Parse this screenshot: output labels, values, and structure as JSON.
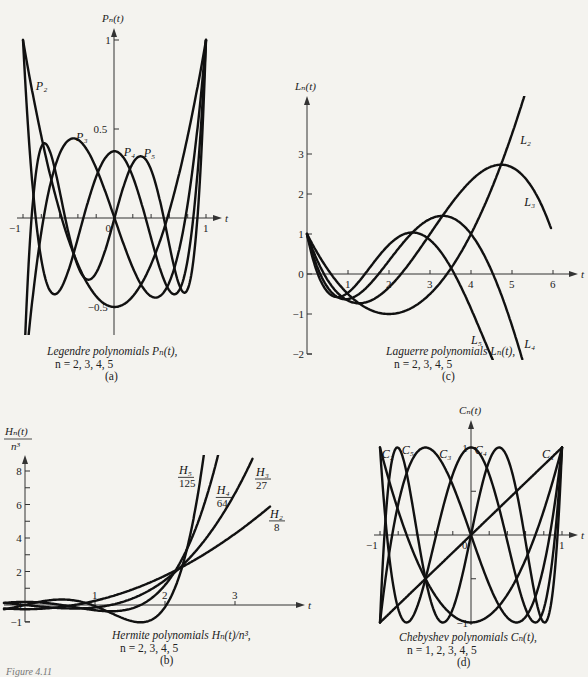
{
  "figure_label": "Figure 4.11",
  "chart_data": [
    {
      "id": "a",
      "type": "line",
      "title": "Legendre polynomials P_n(t), n = 2, 3, 4, 5",
      "caption_line1": "Legendre polynomials Pₙ(t),",
      "caption_line2": "n = 2, 3, 4, 5",
      "panel_label": "(a)",
      "xlabel": "t",
      "ylabel": "Pₙ(t)",
      "xlim": [
        -1,
        1
      ],
      "ylim": [
        -0.6,
        1.05
      ],
      "x_ticks": [
        -1,
        -0.8,
        -0.6,
        -0.4,
        -0.2,
        0,
        0.2,
        0.4,
        0.6,
        0.8,
        1
      ],
      "x_tick_labels": [
        {
          "v": -1,
          "text": "−1"
        },
        {
          "v": 0,
          "text": "0"
        },
        {
          "v": 1,
          "text": "1"
        }
      ],
      "y_ticks": [
        1,
        0.5,
        -0.5
      ],
      "y_tick_labels": [
        {
          "v": 1,
          "text": "1"
        },
        {
          "v": 0.5,
          "text": "0.5"
        },
        {
          "v": -0.5,
          "text": "−0.5"
        }
      ],
      "series": [
        {
          "name": "P2",
          "label": "P₂",
          "coeffs": [
            -0.5,
            0,
            1.5
          ],
          "domain": [
            -1,
            1
          ],
          "label_pos": [
            -0.86,
            0.72
          ]
        },
        {
          "name": "P3",
          "label": "P₃",
          "coeffs": [
            0,
            -1.5,
            0,
            2.5
          ],
          "domain": [
            -1,
            1
          ],
          "label_pos": [
            -0.42,
            0.43
          ]
        },
        {
          "name": "P4",
          "label": "P₄",
          "coeffs": [
            0.375,
            0,
            -3.75,
            0,
            4.375
          ],
          "domain": [
            -1,
            1
          ],
          "label_pos": [
            0.1,
            0.35
          ]
        },
        {
          "name": "P5",
          "label": "P₅",
          "coeffs": [
            0,
            1.875,
            0,
            -8.75,
            0,
            7.875
          ],
          "domain": [
            -1,
            1
          ],
          "label_pos": [
            0.32,
            0.34
          ]
        }
      ],
      "frame": {
        "x0": 23,
        "x1": 206,
        "y_axis_x": 114,
        "y_zero": 218,
        "y_scale": 178,
        "y_top_arrow": 28,
        "y_bottom": 335,
        "x_arrow_end": 222,
        "clip_y": [
          28,
          335
        ]
      }
    },
    {
      "id": "c",
      "type": "line",
      "title": "Laguerre polynomials L_n(t), n = 2, 3, 4, 5",
      "caption_line1": "Laguerre polynomials Lₙ(t),",
      "caption_line2": "n = 2, 3, 4, 5",
      "panel_label": "(c)",
      "xlabel": "t",
      "ylabel": "Lₙ(t)",
      "xlim": [
        0,
        6.5
      ],
      "ylim": [
        -2,
        3.6
      ],
      "x_ticks": [
        1,
        2,
        3,
        4,
        5,
        6
      ],
      "x_tick_labels": [
        {
          "v": 1,
          "text": "1"
        },
        {
          "v": 2,
          "text": "2"
        },
        {
          "v": 3,
          "text": "3"
        },
        {
          "v": 4,
          "text": "4"
        },
        {
          "v": 5,
          "text": "5"
        },
        {
          "v": 6,
          "text": "6"
        }
      ],
      "y_ticks": [
        3,
        2,
        1,
        0,
        -1,
        -2
      ],
      "y_tick_labels": [
        {
          "v": 3,
          "text": "3"
        },
        {
          "v": 2,
          "text": "2"
        },
        {
          "v": 1,
          "text": "1"
        },
        {
          "v": 0,
          "text": "0"
        },
        {
          "v": -1,
          "text": "−1"
        },
        {
          "v": -2,
          "text": "−2"
        }
      ],
      "series": [
        {
          "name": "L2",
          "label": "L₂",
          "coeffs": [
            1,
            -2,
            0.5
          ],
          "domain": [
            0,
            5.3
          ],
          "label_pos": [
            5.2,
            3.25
          ]
        },
        {
          "name": "L3",
          "label": "L₃",
          "coeffs": [
            1,
            -3,
            1.5,
            -0.16666667
          ],
          "domain": [
            0,
            5.95
          ],
          "label_pos": [
            5.3,
            1.7
          ]
        },
        {
          "name": "L4",
          "label": "L₄",
          "coeffs": [
            1,
            -4,
            3,
            -0.66666667,
            0.04166667
          ],
          "domain": [
            0,
            5.25
          ],
          "label_pos": [
            5.3,
            -1.85
          ]
        },
        {
          "name": "L5",
          "label": "L₅",
          "coeffs": [
            1,
            -5,
            5,
            -1.66666667,
            0.20833333,
            -0.00833333
          ],
          "domain": [
            0,
            4.55
          ],
          "label_pos": [
            4.0,
            -1.75
          ]
        }
      ],
      "frame": {
        "x0": 307,
        "x_scale": 41,
        "y_zero": 274,
        "y_scale": 40,
        "y_top_arrow": 96,
        "y_bottom": 354,
        "x_arrow_end": 578,
        "clip_y": [
          96,
          360
        ]
      }
    },
    {
      "id": "b",
      "type": "line",
      "title": "Hermite polynomials H_n(t)/n^3, n = 2, 3, 4, 5",
      "caption_line1": "Hermite polynomials Hₙ(t)/n³,",
      "caption_line2": "n = 2, 3, 4, 5",
      "panel_label": "(b)",
      "xlabel": "t",
      "ylabel": "Hₙ(t) / n³",
      "xlim": [
        -0.3,
        4.1
      ],
      "ylim": [
        -1,
        8.5
      ],
      "x_ticks": [
        1,
        2,
        3
      ],
      "x_tick_labels": [
        {
          "v": 1,
          "text": "1"
        },
        {
          "v": 2,
          "text": "2"
        },
        {
          "v": 3,
          "text": "3"
        }
      ],
      "y_ticks": [
        8,
        7,
        6,
        5,
        4,
        3,
        2,
        1,
        0,
        -1
      ],
      "y_tick_labels": [
        {
          "v": 8,
          "text": "8"
        },
        {
          "v": 6,
          "text": "6"
        },
        {
          "v": 4,
          "text": "4"
        },
        {
          "v": 2,
          "text": "2"
        },
        {
          "v": 0,
          "text": "0"
        },
        {
          "v": -1,
          "text": "−1"
        }
      ],
      "series": [
        {
          "name": "H2/8",
          "label_num": "H₂",
          "label_den": "8",
          "coeffs": [
            -0.25,
            0,
            0.5
          ],
          "domain": [
            -0.3,
            3.5
          ],
          "label_pos": [
            3.5,
            5.2
          ]
        },
        {
          "name": "H3/27",
          "label_num": "H₃",
          "label_den": "27",
          "coeffs": [
            0,
            -0.44444444,
            0,
            0.2962963
          ],
          "domain": [
            -0.3,
            3.25
          ],
          "label_pos": [
            3.3,
            7.7
          ]
        },
        {
          "name": "H4/64",
          "label_num": "H₄",
          "label_den": "64",
          "coeffs": [
            0.1875,
            0,
            -0.75,
            0,
            0.25
          ],
          "domain": [
            -0.3,
            2.85
          ],
          "label_pos": [
            2.74,
            6.6
          ]
        },
        {
          "name": "H5/125",
          "label_num": "H₅",
          "label_den": "125",
          "coeffs": [
            0,
            0.96,
            0,
            -1.28,
            0,
            0.256
          ],
          "domain": [
            -0.3,
            2.62
          ],
          "label_pos": [
            2.2,
            7.8
          ]
        }
      ],
      "frame": {
        "x0": 25,
        "x_scale": 70,
        "y_zero": 605,
        "y_scale": 16.75,
        "y_top_arrow": 455,
        "y_bottom": 622,
        "x_arrow_end": 305,
        "x_start": 4,
        "clip_y": [
          455,
          630
        ]
      }
    },
    {
      "id": "d",
      "type": "line",
      "title": "Chebyshev polynomials C_n(t), n = 1, 2, 3, 4, 5",
      "caption_line1": "Chebyshev polynomials Cₙ(t),",
      "caption_line2": "n = 1, 2, 3, 4, 5",
      "panel_label": "(d)",
      "xlabel": "t",
      "ylabel": "Cₙ(t)",
      "xlim": [
        -1,
        1
      ],
      "ylim": [
        -1,
        1
      ],
      "x_ticks": [
        -1,
        -0.8,
        -0.6,
        -0.4,
        -0.2,
        0,
        0.2,
        0.4,
        0.6,
        0.8,
        1
      ],
      "x_tick_labels": [
        {
          "v": -1,
          "text": "−1"
        },
        {
          "v": 0,
          "text": "0"
        },
        {
          "v": 1,
          "text": "1"
        }
      ],
      "y_ticks": [
        1,
        0.5,
        -0.5,
        -1
      ],
      "y_tick_labels": [
        {
          "v": 1,
          "text": "1"
        },
        {
          "v": -1,
          "text": "−1"
        }
      ],
      "series": [
        {
          "name": "C1",
          "label": "C₁",
          "coeffs": [
            0,
            1
          ],
          "domain": [
            -1,
            1
          ],
          "label_pos": [
            0.78,
            0.88
          ]
        },
        {
          "name": "C2",
          "label": "C₂",
          "coeffs": [
            -1,
            0,
            2
          ],
          "domain": [
            -1,
            1
          ],
          "label_pos": [
            -0.98,
            0.88
          ]
        },
        {
          "name": "C3",
          "label": "C₃",
          "coeffs": [
            0,
            -3,
            0,
            4
          ],
          "domain": [
            -1,
            1
          ],
          "label_pos": [
            -0.35,
            0.88
          ]
        },
        {
          "name": "C4",
          "label": "C₄",
          "coeffs": [
            1,
            0,
            -8,
            0,
            8
          ],
          "domain": [
            -1,
            1
          ],
          "label_pos": [
            0.04,
            0.93
          ]
        },
        {
          "name": "C5",
          "label": "C₅",
          "coeffs": [
            0,
            5,
            0,
            -20,
            0,
            16
          ],
          "domain": [
            -1,
            1
          ],
          "label_pos": [
            -0.76,
            0.93
          ]
        }
      ],
      "frame": {
        "x0": 380,
        "x1": 562,
        "y_axis_x": 471,
        "y_zero": 535,
        "y_scale": 87.5,
        "y_top_arrow": 420,
        "y_bottom": 625,
        "x_arrow_end": 578,
        "clip_y": [
          420,
          630
        ]
      }
    }
  ]
}
